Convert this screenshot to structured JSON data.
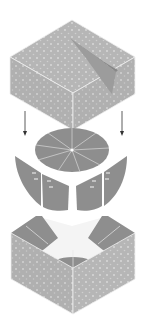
{
  "diagram": {
    "parts": [
      {
        "id": "top-box",
        "label": "Top box (lid)"
      },
      {
        "id": "flap",
        "label": "Curled flap"
      },
      {
        "id": "arrow-left",
        "label": "Down arrow left"
      },
      {
        "id": "arrow-right",
        "label": "Down arrow right"
      },
      {
        "id": "disc",
        "label": "Segmented disc insert"
      },
      {
        "id": "panels",
        "label": "Curved folded panels"
      },
      {
        "id": "bottom-box",
        "label": "Bottom box (base)"
      }
    ],
    "colors": {
      "box_texture": "#b4b4b4",
      "box_dot": "#d6d6d6",
      "box_edge": "#eeeeee",
      "insert_dark": "#8c8c8c",
      "insert_line": "#d8d8d8",
      "flap": "#9a9a9a",
      "arrow": "#333333",
      "background": "#ffffff"
    }
  }
}
